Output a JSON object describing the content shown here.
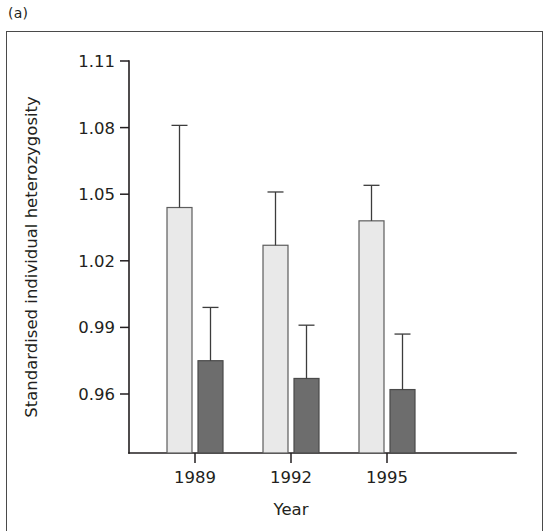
{
  "panel": {
    "label": "(a)"
  },
  "colors": {
    "light_bar_fill": "#e9e9e9",
    "light_bar_stroke": "#5d5d5d",
    "dark_bar_fill": "#6d6d6d",
    "dark_bar_stroke": "#4a4a4a",
    "axis": "#231f20",
    "frame": "#4a4a4a",
    "background": "#ffffff"
  },
  "chart_data": {
    "type": "bar",
    "title": "",
    "subtitle": "",
    "xlabel": "Year",
    "ylabel": "Standardised individual heterozygosity",
    "categories": [
      "1989",
      "1992",
      "1995"
    ],
    "yticks": [
      "1.11",
      "1.08",
      "1.05",
      "1.02",
      "0.99",
      "0.96"
    ],
    "ytick_values": [
      1.11,
      1.08,
      1.05,
      1.02,
      0.99,
      0.96
    ],
    "ylim": [
      0.947,
      1.11
    ],
    "xlim": [
      0,
      3
    ],
    "grid": false,
    "legend": "none",
    "error_type": "upper error bar",
    "series": [
      {
        "name": "light",
        "color": "#e9e9e9",
        "values": [
          1.044,
          1.027,
          1.038
        ],
        "error_upper": [
          1.081,
          1.051,
          1.054
        ]
      },
      {
        "name": "dark",
        "color": "#6d6d6d",
        "values": [
          0.975,
          0.967,
          0.962
        ],
        "error_upper": [
          0.999,
          0.991,
          0.987
        ]
      }
    ]
  }
}
